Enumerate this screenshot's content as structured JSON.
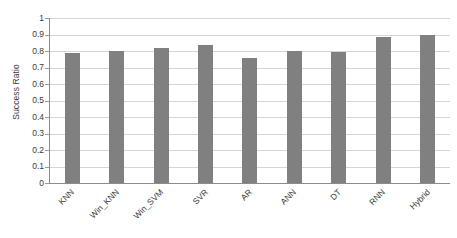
{
  "chart_data": {
    "type": "bar",
    "title": "",
    "subtitle": "",
    "xlabel": "",
    "ylabel": "Success Ratio",
    "categories": [
      "KNN",
      "Win_KNN",
      "Win_SVM",
      "SVR",
      "AR",
      "ANN",
      "DT",
      "RNN",
      "Hybrid"
    ],
    "values": [
      0.79,
      0.8,
      0.82,
      0.835,
      0.755,
      0.8,
      0.795,
      0.885,
      0.895
    ],
    "ylim": [
      0,
      1
    ],
    "ytick_labels": [
      "1",
      "0.9",
      "0.8",
      "0.7",
      "0.6",
      "0.5",
      "0.4",
      "0.3",
      "0.2",
      "0.1",
      "0"
    ],
    "ytick_values": [
      1,
      0.9,
      0.8,
      0.7,
      0.6,
      0.5,
      0.4,
      0.3,
      0.2,
      0.1,
      0
    ],
    "grid": true,
    "grid_axis": "y",
    "legend": false,
    "legend_position": "none",
    "bar_color": "#808080",
    "grid_color": "#d6d6d6",
    "axis_color": "#8c8c8c",
    "text_color": "#3a3a3a",
    "background_color": "#ffffff",
    "xtick_label_rotation": -45
  }
}
